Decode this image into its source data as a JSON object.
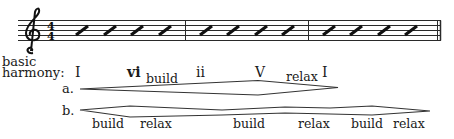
{
  "staff": {
    "clef": "treble",
    "time_signature": {
      "top": "4",
      "bottom": "4"
    },
    "measures": [
      {
        "slashes": 4
      },
      {
        "slashes": 4
      },
      {
        "slashes": 4
      }
    ],
    "ending_barline": "double"
  },
  "harmony": {
    "label_line1": "basic",
    "label_line2": "harmony:",
    "chords": [
      {
        "symbol": "I",
        "bold": false
      },
      {
        "symbol": "vi",
        "bold": true
      },
      {
        "symbol": "ii",
        "bold": false
      },
      {
        "symbol": "V",
        "bold": false
      },
      {
        "symbol": "I",
        "bold": false
      }
    ]
  },
  "row_a": {
    "label": "a.",
    "words": [
      "build",
      "relax"
    ]
  },
  "row_b": {
    "label": "b.",
    "words": [
      "build",
      "relax",
      "build",
      "relax",
      "build",
      "relax"
    ]
  }
}
